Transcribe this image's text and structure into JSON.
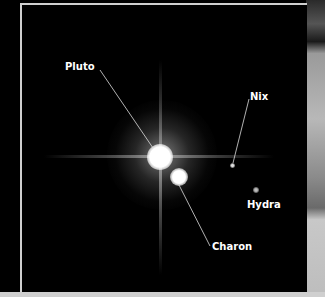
{
  "image": {
    "subject": "Pluto system",
    "labels": [
      {
        "id": "pluto",
        "text": "Pluto"
      },
      {
        "id": "nix",
        "text": "Nix"
      },
      {
        "id": "hydra",
        "text": "Hydra"
      },
      {
        "id": "charon",
        "text": "Charon"
      }
    ]
  }
}
